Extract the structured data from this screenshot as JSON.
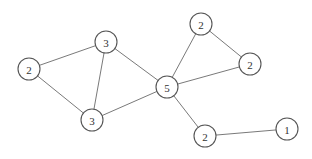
{
  "diagram": {
    "type": "undirected-graph",
    "node_radius": 11,
    "nodes": [
      {
        "id": "a",
        "label": "2",
        "x": 29,
        "y": 69
      },
      {
        "id": "b",
        "label": "3",
        "x": 106,
        "y": 42
      },
      {
        "id": "c",
        "label": "3",
        "x": 92,
        "y": 120
      },
      {
        "id": "d",
        "label": "5",
        "x": 167,
        "y": 87
      },
      {
        "id": "e",
        "label": "2",
        "x": 201,
        "y": 24
      },
      {
        "id": "f",
        "label": "2",
        "x": 250,
        "y": 64
      },
      {
        "id": "g",
        "label": "2",
        "x": 205,
        "y": 136
      },
      {
        "id": "h",
        "label": "1",
        "x": 287,
        "y": 129
      }
    ],
    "edges": [
      {
        "from": "a",
        "to": "b"
      },
      {
        "from": "a",
        "to": "c"
      },
      {
        "from": "b",
        "to": "c"
      },
      {
        "from": "b",
        "to": "d"
      },
      {
        "from": "c",
        "to": "d"
      },
      {
        "from": "d",
        "to": "e"
      },
      {
        "from": "d",
        "to": "f"
      },
      {
        "from": "e",
        "to": "f"
      },
      {
        "from": "d",
        "to": "g"
      },
      {
        "from": "g",
        "to": "h"
      }
    ],
    "colors": {
      "background": "#ffffff",
      "edge": "#6a6a6a",
      "node_stroke": "#555555",
      "node_fill": "#ffffff",
      "label": "#333333"
    }
  }
}
